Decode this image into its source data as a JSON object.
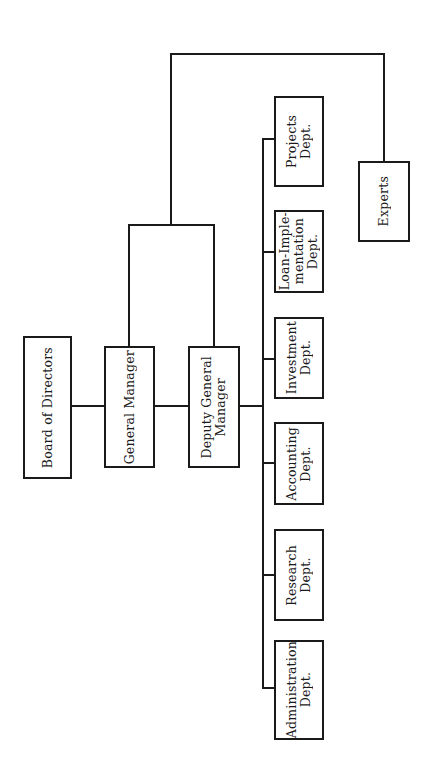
{
  "diagram": {
    "type": "organizational-chart",
    "orientation": "rotated-90-ccw",
    "nodes": {
      "board": {
        "label": "Board of Directors"
      },
      "general_manager": {
        "label": "General Manager"
      },
      "deputy_gm": {
        "label": "Deputy General\nManager"
      },
      "experts": {
        "label": "Experts"
      },
      "projects": {
        "label": "Projects Dept."
      },
      "loan_implementation": {
        "label": "Loan-Imple-\nmentation\nDept."
      },
      "investment": {
        "label": "Investment\nDept."
      },
      "accounting": {
        "label": "Accounting\nDept."
      },
      "research": {
        "label": "Research\nDept."
      },
      "administration": {
        "label": "Administration\nDept."
      }
    },
    "edges": [
      [
        "Board of Directors",
        "General Manager"
      ],
      [
        "General Manager",
        "Deputy General Manager"
      ],
      [
        "General Manager + Deputy General Manager",
        "Experts"
      ],
      [
        "Deputy General Manager",
        "Projects Dept."
      ],
      [
        "Deputy General Manager",
        "Loan-Implementation Dept."
      ],
      [
        "Deputy General Manager",
        "Investment Dept."
      ],
      [
        "Deputy General Manager",
        "Accounting Dept."
      ],
      [
        "Deputy General Manager",
        "Research Dept."
      ],
      [
        "Deputy General Manager",
        "Administration Dept."
      ]
    ],
    "colors": {
      "line": "#1a1a1a",
      "background": "#ffffff"
    }
  }
}
